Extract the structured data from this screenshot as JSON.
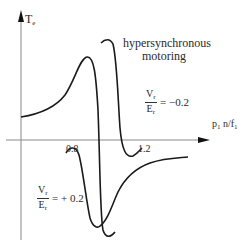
{
  "diagram": {
    "y_axis_label": "T",
    "y_axis_label_sub": "e",
    "x_axis_label": "p",
    "x_axis_label_sub1": "1",
    "x_axis_label_mid": " n/f",
    "x_axis_label_sub2": "1",
    "tick_0_8": "0.8",
    "tick_1_2": "1.2",
    "annotation_line1": "hypersynchronous",
    "annotation_line2": "motoring",
    "ratio_neg": {
      "num": "V",
      "num_sub": "r",
      "den": "E",
      "den_sub": "r",
      "value": "= −0.2"
    },
    "ratio_pos": {
      "num": "V",
      "num_sub": "r",
      "den": "E",
      "den_sub": "r",
      "value": "= + 0.2"
    },
    "colors": {
      "curve": "#1a1a1a",
      "axis": "#888888",
      "text": "#2a2a2a"
    }
  }
}
